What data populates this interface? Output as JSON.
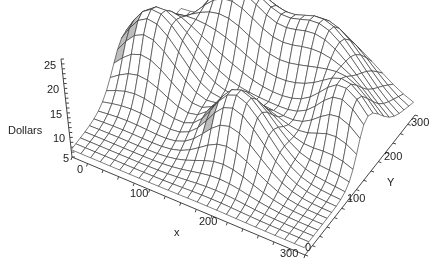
{
  "chart_data": {
    "type": "surface3d",
    "title": "",
    "xlabel": "x",
    "ylabel": "Y",
    "zlabel": "Dollars",
    "xlim": [
      0,
      300
    ],
    "ylim": [
      0,
      300
    ],
    "zlim": [
      5,
      25
    ],
    "x_ticks": [
      "0",
      "100",
      "200",
      "300"
    ],
    "y_ticks": [
      "0",
      "100",
      "200",
      "300"
    ],
    "z_ticks": [
      "5",
      "10",
      "15",
      "20",
      "25"
    ],
    "grid_resolution": 24,
    "base_level": 6.5,
    "peaks": [
      {
        "x": 40,
        "y": 160,
        "height": 23,
        "sigma": 38
      },
      {
        "x": 110,
        "y": 245,
        "height": 25,
        "sigma": 42
      },
      {
        "x": 215,
        "y": 255,
        "height": 23,
        "sigma": 42
      },
      {
        "x": 175,
        "y": 105,
        "height": 21,
        "sigma": 35
      },
      {
        "x": 275,
        "y": 185,
        "height": 19,
        "sigma": 32
      }
    ],
    "style": {
      "mesh_color": "#2a2a2a",
      "face_color": "#ffffff",
      "shade_color": "#bdbdbd",
      "axis_color": "#444444"
    }
  },
  "labels": {
    "z_axis": "Dollars",
    "x_axis": "x",
    "y_axis": "Y"
  }
}
